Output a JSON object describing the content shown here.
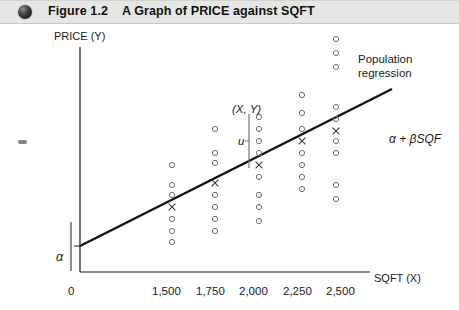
{
  "header": {
    "bullet_icon": "filled-circle-icon",
    "figure_number": "Figure 1.2",
    "caption": "A Graph of PRICE against SQFT"
  },
  "chart_data": {
    "type": "scatter",
    "title": "A Graph of PRICE against SQFT",
    "xlabel": "SQFT (X)",
    "ylabel": "PRICE (Y)",
    "grid": false,
    "legend": "none",
    "x_tick_labels": [
      "0",
      "1,500",
      "1,750",
      "2,000",
      "2,250",
      "2,500"
    ],
    "x_tick_values": [
      0,
      1500,
      1750,
      2000,
      2250,
      2500
    ],
    "y_tick_labels": [],
    "annotations": [
      {
        "name": "population-regression",
        "text": "Population regression"
      },
      {
        "name": "regression-equation",
        "text": "α + βSQF"
      },
      {
        "name": "observation-point",
        "text": "(X, Y)"
      },
      {
        "name": "residual",
        "text": "u"
      },
      {
        "name": "intercept",
        "text": "α"
      }
    ],
    "regression_line": {
      "label": "α + βSQF",
      "x_start_px": 80,
      "y_start_px": 224,
      "x_end_px": 392,
      "y_end_px": 67
    },
    "series": [
      {
        "name": "SQFT 1,500",
        "x": 1500,
        "x_px": 172,
        "y_px": [
          143,
          163,
          173,
          197,
          209,
          220
        ]
      },
      {
        "name": "SQFT 1,750",
        "x": 1750,
        "x_px": 215,
        "y_px": [
          107,
          131,
          141,
          173,
          185,
          197,
          209
        ]
      },
      {
        "name": "SQFT 2,000",
        "x": 2000,
        "x_px": 259,
        "y_px": [
          95,
          107,
          119,
          131,
          155,
          173,
          185,
          199
        ]
      },
      {
        "name": "SQFT 2,250",
        "x": 2250,
        "x_px": 302,
        "y_px": [
          73,
          91,
          107,
          131,
          143,
          155,
          167
        ]
      },
      {
        "name": "SQFT 2,500",
        "x": 2500,
        "x_px": 336,
        "y_px": [
          17,
          31,
          45,
          85,
          97,
          119,
          131,
          163,
          177
        ]
      }
    ],
    "mean_markers_px": [
      {
        "x_px": 172,
        "y_px": 185
      },
      {
        "x_px": 215,
        "y_px": 161
      },
      {
        "x_px": 259,
        "y_px": 143
      },
      {
        "x_px": 302,
        "y_px": 119
      },
      {
        "x_px": 336,
        "y_px": 109
      }
    ],
    "residual_segment_px": {
      "x_px": 249,
      "y_top_px": 92,
      "y_bottom_px": 146
    }
  }
}
